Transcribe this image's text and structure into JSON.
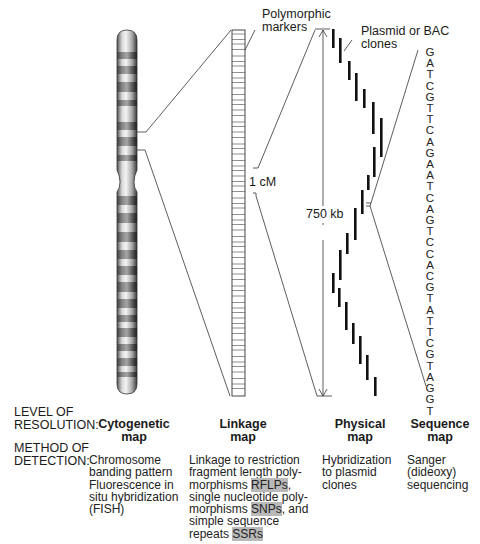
{
  "labels": {
    "polymorphic_markers_line1": "Polymorphic",
    "polymorphic_markers_line2": "markers",
    "clones_line1": "Plasmid or BAC",
    "clones_line2": "clones",
    "one_cm": "1 cM",
    "kb_750": "750 kb"
  },
  "sequence": [
    "G",
    "A",
    "T",
    "C",
    "G",
    "T",
    "T",
    "C",
    "A",
    "G",
    "A",
    "A",
    "T",
    "C",
    "A",
    "G",
    "T",
    "C",
    "C",
    "A",
    "C",
    "G",
    "T",
    "A",
    "T",
    "T",
    "C",
    "G",
    "T",
    "A",
    "G",
    "G",
    "T"
  ],
  "rows": {
    "level_label_line1": "LEVEL OF",
    "level_label_line2": "RESOLUTION:",
    "method_label_line1": "METHOD OF",
    "method_label_line2": "DETECTION:"
  },
  "maps": [
    {
      "title_line1": "Cytogenetic",
      "title_line2": "map",
      "method": [
        "Chromosome",
        "banding pattern",
        "Fluorescence in",
        "situ hybridization",
        "(FISH)"
      ]
    },
    {
      "title_line1": "Linkage",
      "title_line2": "map",
      "method_parts": {
        "l1": "Linkage to restriction",
        "l2": "fragment length poly-",
        "l3a": "morphisms ",
        "l3b": "RFLPs",
        "l3c": ",",
        "l4": "single nucleotide poly-",
        "l5a": "morphisms ",
        "l5b": "SNPs",
        "l5c": ", and",
        "l6": "simple sequence",
        "l7a": "repeats ",
        "l7b": "SSRs"
      }
    },
    {
      "title_line1": "Physical",
      "title_line2": "map",
      "method": [
        "Hybridization",
        "to plasmid",
        "clones"
      ]
    },
    {
      "title_line1": "Sequence",
      "title_line2": "map",
      "method": [
        "Sanger",
        "(dideoxy)",
        "sequencing"
      ]
    }
  ],
  "colors": {
    "highlight": "#b9b9b9",
    "line": "#333333",
    "clone_bar": "#111111"
  }
}
